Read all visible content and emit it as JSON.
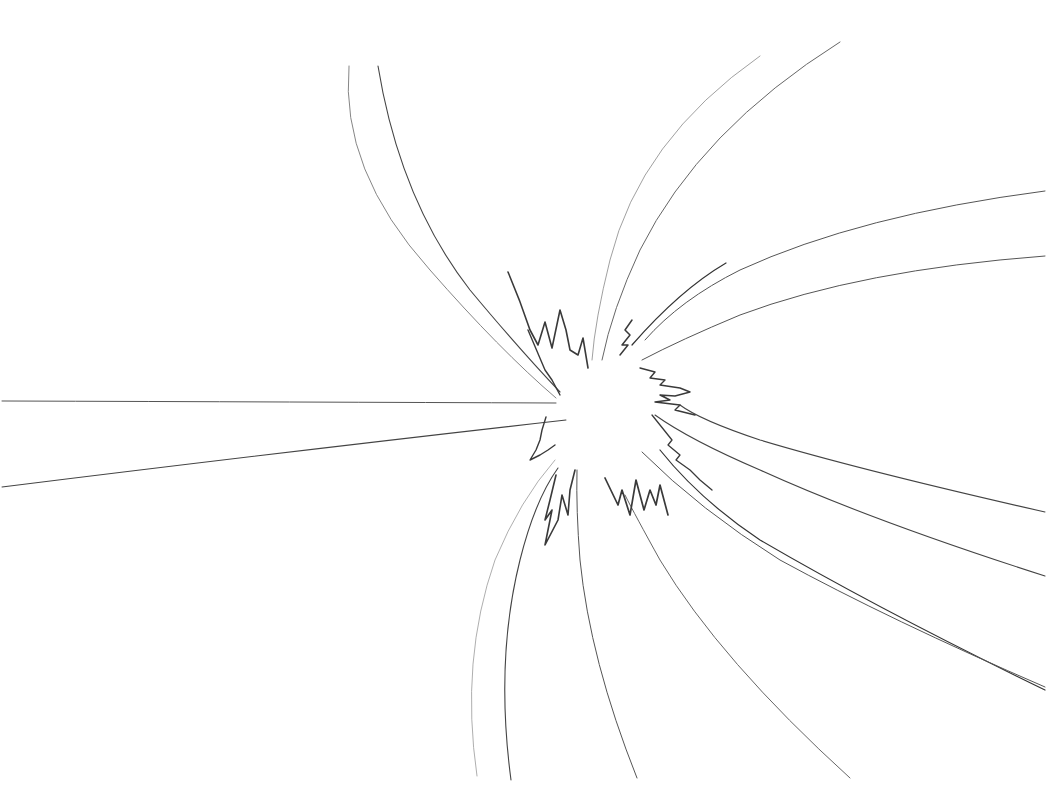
{
  "image": {
    "description": "Hand-drawn pencil sketch of a burst / explosion: thin curved lines radiating outward from an empty central point, with jagged zig-zag spikes surrounding the center.",
    "background_color": "#ffffff",
    "stroke_color": "#3a3a3a",
    "light_stroke_color": "#8a8a8a"
  },
  "burst": {
    "center": [
      605,
      415
    ],
    "rays": [
      {
        "name": "ray-left-upper",
        "d": "M 2 401 Q 300 402 556 403",
        "w": 1.0,
        "c": "#555"
      },
      {
        "name": "ray-left-lower",
        "d": "M 2 487 Q 300 450 566 420",
        "w": 1.1,
        "c": "#444"
      },
      {
        "name": "ray-top-left-outer",
        "d": "M 349 66 Q 340 170 430 270 Q 500 350 556 398",
        "w": 0.9,
        "c": "#777"
      },
      {
        "name": "ray-top-left-inner",
        "d": "M 378 66 Q 400 200 470 290 Q 520 350 560 392",
        "w": 1.1,
        "c": "#444"
      },
      {
        "name": "ray-top-right-outer",
        "d": "M 760 56 Q 640 140 610 260 Q 595 320 592 360",
        "w": 0.8,
        "c": "#888"
      },
      {
        "name": "ray-top-right-inner",
        "d": "M 840 42 Q 700 130 640 250 Q 612 310 602 360",
        "w": 1.0,
        "c": "#666"
      },
      {
        "name": "ray-upper-right-short",
        "d": "M 726 263 Q 680 290 632 345",
        "w": 1.2,
        "c": "#333"
      },
      {
        "name": "ray-right-upper",
        "d": "M 1045 191 Q 860 215 740 270 Q 680 300 645 340",
        "w": 1.0,
        "c": "#555"
      },
      {
        "name": "ray-right-middle",
        "d": "M 1045 256 Q 860 270 740 315 Q 680 340 642 360",
        "w": 1.0,
        "c": "#555"
      },
      {
        "name": "ray-right-lower-1",
        "d": "M 1045 512 Q 860 470 760 440 Q 700 420 680 405",
        "w": 1.1,
        "c": "#444"
      },
      {
        "name": "ray-right-lower-2",
        "d": "M 1045 576 Q 870 520 760 470 Q 690 440 655 415",
        "w": 1.1,
        "c": "#444"
      },
      {
        "name": "ray-right-lower-3",
        "d": "M 1045 690 Q 880 610 760 540 Q 700 500 660 450",
        "w": 1.2,
        "c": "#333"
      },
      {
        "name": "ray-right-lower-4",
        "d": "M 1045 687 Q 890 620 780 560 Q 700 510 642 452",
        "w": 1.0,
        "c": "#555"
      },
      {
        "name": "ray-bottom-right",
        "d": "M 850 778 Q 720 660 660 560 Q 635 515 625 495",
        "w": 1.0,
        "c": "#666"
      },
      {
        "name": "ray-bottom-middle",
        "d": "M 637 778 Q 590 660 580 560 Q 576 510 577 470",
        "w": 1.0,
        "c": "#555"
      },
      {
        "name": "ray-bottom-left-inner",
        "d": "M 511 780 Q 495 660 520 560 Q 535 500 558 468",
        "w": 1.1,
        "c": "#444"
      },
      {
        "name": "ray-bottom-left-outer",
        "d": "M 477 776 Q 460 660 495 560 Q 520 500 555 460",
        "w": 0.8,
        "c": "#999"
      }
    ],
    "spikes": [
      {
        "name": "spike-top-left",
        "d": "M 508 272 Q 520 300 530 330 L 538 345 L 545 322 L 552 348 L 560 310 L 566 330 L 570 350 L 578 355 L 583 338 L 588 368",
        "w": 1.6
      },
      {
        "name": "spike-top-left-inner",
        "d": "M 528 330 L 545 370 L 552 380 L 560 395",
        "w": 1.4
      },
      {
        "name": "spike-top-right-small",
        "d": "M 632 320 L 625 330 L 630 335 L 622 345 L 628 345 L 620 355",
        "w": 1.5
      },
      {
        "name": "spike-right",
        "d": "M 640 368 L 655 372 L 650 378 L 665 380 L 660 385 L 680 388 L 690 392 L 675 396 L 660 395 L 670 400 L 655 402 L 680 405 L 675 410 L 695 415",
        "w": 1.4
      },
      {
        "name": "spike-right-lower",
        "d": "M 652 415 L 672 440 L 668 445 L 680 455 L 676 460 L 690 470 L 700 480 L 712 490",
        "w": 1.3
      },
      {
        "name": "spike-bottom-right",
        "d": "M 605 478 L 618 505 L 622 490 L 630 515 L 636 480 L 644 510 L 650 490 L 656 505 L 660 485 L 668 515",
        "w": 1.7
      },
      {
        "name": "spike-bottom-left",
        "d": "M 556 475 L 550 500 L 545 520 L 552 510 L 545 545 L 558 520 L 562 495 L 568 515 L 570 490 L 575 470",
        "w": 1.6
      },
      {
        "name": "spike-left",
        "d": "M 546 417 L 542 430 L 540 440 L 536 450 L 530 460 L 540 455 L 548 450 L 555 445",
        "w": 1.4
      }
    ]
  }
}
